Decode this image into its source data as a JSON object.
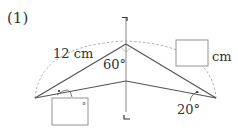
{
  "problem_label": "(1)",
  "figure": {
    "side_label": "12 cm",
    "angle_top": "60°",
    "angle_right": "20°",
    "unknown_length_unit": "cm",
    "left_box_degree_mark": "°",
    "fold_marks": {
      "top": "¬",
      "bottom": "L"
    }
  },
  "colors": {
    "line": "#555555",
    "dashed": "#999999",
    "text": "#333333",
    "box_border": "#888888"
  }
}
